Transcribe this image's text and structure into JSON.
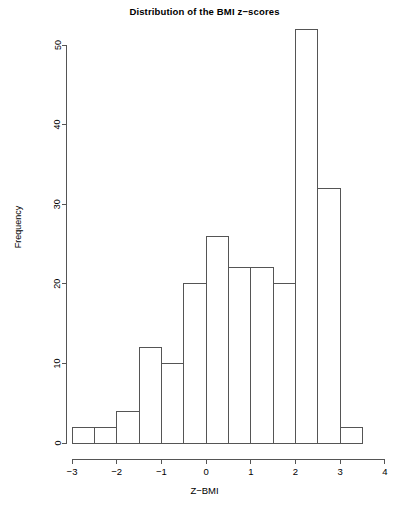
{
  "chart_data": {
    "type": "bar",
    "title": "Distribution of the BMI z−scores",
    "xlabel": "Z−BMI",
    "ylabel": "Frequency",
    "grid": false,
    "legend": null,
    "bin_width": 0.5,
    "bin_edges": [
      -3,
      -2.5,
      -2,
      -1.5,
      -1,
      -0.5,
      0,
      0.5,
      1,
      1.5,
      2,
      2.5,
      3,
      3.5
    ],
    "categories": [
      "-3 to -2.5",
      "-2.5 to -2",
      "-2 to -1.5",
      "-1.5 to -1",
      "-1 to -0.5",
      "-0.5 to 0",
      "0 to 0.5",
      "0.5 to 1",
      "1 to 1.5",
      "1.5 to 2",
      "2 to 2.5",
      "2.5 to 3",
      "3 to 3.5"
    ],
    "values": [
      2,
      2,
      4,
      12,
      10,
      20,
      26,
      22,
      22,
      20,
      52,
      32,
      2
    ],
    "xlim": [
      -3.3,
      4.05
    ],
    "ylim": [
      0,
      52
    ],
    "x_ticks": [
      -3,
      -2,
      -1,
      0,
      1,
      2,
      3,
      4
    ],
    "x_tick_labels": [
      "−3",
      "−2",
      "−1",
      "0",
      "1",
      "2",
      "3",
      "4"
    ],
    "y_ticks": [
      0,
      10,
      20,
      30,
      40,
      50
    ],
    "y_tick_labels": [
      "0",
      "10",
      "20",
      "30",
      "40",
      "50"
    ],
    "colors": {
      "bar_fill": "#ffffff",
      "bar_stroke": "#555555",
      "axis": "#555555",
      "text": "#000000",
      "background": "#ffffff"
    }
  },
  "footer": {
    "caption": ""
  }
}
